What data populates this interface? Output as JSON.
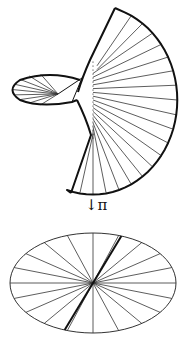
{
  "figure": {
    "map_label": "↓π",
    "colors": {
      "stroke": "#111111",
      "thin_stroke": "#333333",
      "background": "#ffffff"
    }
  },
  "top_surface": {
    "fan_tip_top": [
      115,
      8
    ],
    "fan_tip_bottom": [
      71,
      193
    ],
    "spine_x": 93,
    "spine_y_range": [
      62,
      138
    ],
    "arc_rightmost": [
      174,
      95
    ],
    "ruling_count": 20,
    "loop": {
      "left_x": 12,
      "right_x": 80,
      "top_y": 74,
      "bottom_y": 105
    }
  },
  "bottom_ellipse": {
    "cx": 93,
    "cy": 283,
    "rx": 83,
    "ry": 50,
    "spoke_count": 20,
    "highlight_spoke_angle_deg": 70
  }
}
